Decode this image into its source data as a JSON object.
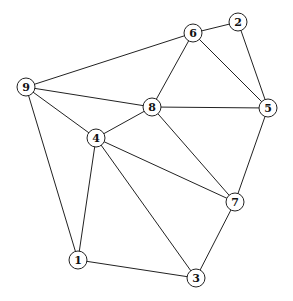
{
  "graph": {
    "type": "undirected",
    "nodes": [
      {
        "id": "1",
        "label": "1",
        "x": 78,
        "y": 260
      },
      {
        "id": "2",
        "label": "2",
        "x": 238,
        "y": 22
      },
      {
        "id": "3",
        "label": "3",
        "x": 196,
        "y": 278
      },
      {
        "id": "4",
        "label": "4",
        "x": 96,
        "y": 138
      },
      {
        "id": "5",
        "label": "5",
        "x": 268,
        "y": 108
      },
      {
        "id": "6",
        "label": "6",
        "x": 193,
        "y": 33
      },
      {
        "id": "7",
        "label": "7",
        "x": 235,
        "y": 202
      },
      {
        "id": "8",
        "label": "8",
        "x": 152,
        "y": 107
      },
      {
        "id": "9",
        "label": "9",
        "x": 26,
        "y": 87
      }
    ],
    "edges": [
      [
        "9",
        "6"
      ],
      [
        "9",
        "8"
      ],
      [
        "9",
        "4"
      ],
      [
        "9",
        "1"
      ],
      [
        "6",
        "2"
      ],
      [
        "6",
        "8"
      ],
      [
        "6",
        "5"
      ],
      [
        "2",
        "5"
      ],
      [
        "8",
        "5"
      ],
      [
        "8",
        "4"
      ],
      [
        "8",
        "7"
      ],
      [
        "4",
        "7"
      ],
      [
        "4",
        "1"
      ],
      [
        "4",
        "3"
      ],
      [
        "5",
        "7"
      ],
      [
        "7",
        "3"
      ],
      [
        "1",
        "3"
      ]
    ],
    "node_radius": 9
  }
}
